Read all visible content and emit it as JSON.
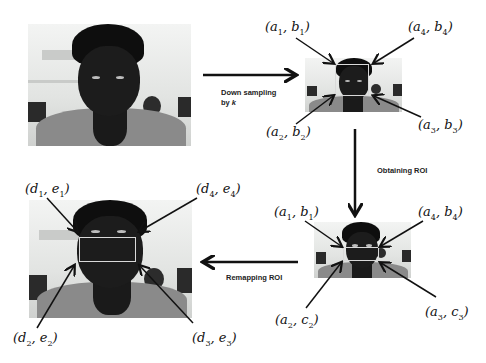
{
  "steps": {
    "downsample_line1": "Down sampling",
    "downsample_line2": "by ",
    "downsample_k": "k",
    "obtain_roi": "Obtaining ROI",
    "remap_roi": "Remapping ROI"
  },
  "panels": {
    "original": {
      "name": "Original frame"
    },
    "downsampled": {
      "name": "Down-sampled frame",
      "labels": [
        {
          "v": "a",
          "i": "1",
          "w": "b",
          "j": "1"
        },
        {
          "v": "a",
          "i": "4",
          "w": "b",
          "j": "4"
        },
        {
          "v": "a",
          "i": "2",
          "w": "b",
          "j": "2"
        },
        {
          "v": "a",
          "i": "3",
          "w": "b",
          "j": "3"
        }
      ]
    },
    "roi": {
      "name": "Down-sampled frame with ROI",
      "labels": [
        {
          "v": "a",
          "i": "1",
          "w": "b",
          "j": "1"
        },
        {
          "v": "a",
          "i": "4",
          "w": "b",
          "j": "4"
        },
        {
          "v": "a",
          "i": "2",
          "w": "c",
          "j": "2"
        },
        {
          "v": "a",
          "i": "3",
          "w": "c",
          "j": "3"
        }
      ]
    },
    "remapped": {
      "name": "Original frame with remapped ROI",
      "labels": [
        {
          "v": "d",
          "i": "1",
          "w": "e",
          "j": "1"
        },
        {
          "v": "d",
          "i": "4",
          "w": "e",
          "j": "4"
        },
        {
          "v": "d",
          "i": "2",
          "w": "e",
          "j": "2"
        },
        {
          "v": "d",
          "i": "3",
          "w": "e",
          "j": "3"
        }
      ]
    }
  },
  "colors": {
    "arrow": "#111111",
    "roi_box": "#d9d9d9",
    "background": "#ffffff"
  }
}
